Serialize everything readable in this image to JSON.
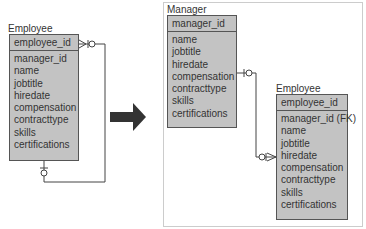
{
  "before": {
    "entity": {
      "title": "Employee",
      "primary_key": "employee_id",
      "attributes": [
        "manager_id",
        "name",
        "jobtitle",
        "hiredate",
        "compensation",
        "contracttype",
        "skills",
        "certifications"
      ]
    }
  },
  "arrow": {
    "icon": "right-arrow-icon",
    "color": "#333333"
  },
  "after": {
    "manager": {
      "title": "Manager",
      "primary_key": "manager_id",
      "attributes": [
        "name",
        "jobtitle",
        "hiredate",
        "compensation",
        "contracttype",
        "skills",
        "certifications"
      ]
    },
    "employee": {
      "title": "Employee",
      "primary_key": "employee_id",
      "attributes": [
        "manager_id (FK)",
        "name",
        "jobtitle",
        "hiredate",
        "compensation",
        "contracttype",
        "skills",
        "certifications"
      ]
    }
  },
  "colors": {
    "entity_fill": "#c3c3c3",
    "border": "#555555",
    "line": "#444444"
  }
}
